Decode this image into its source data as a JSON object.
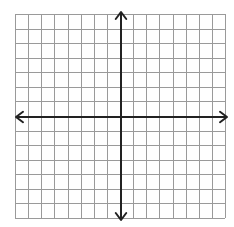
{
  "diagram": {
    "type": "coordinate-plane",
    "grid": {
      "columns": 16,
      "rows": 14,
      "left": 15,
      "top": 14,
      "right": 225,
      "bottom": 218,
      "line_color": "#9a9a9a",
      "line_width": 1
    },
    "axes": {
      "color": "#222222",
      "width": 2,
      "x_axis": {
        "y": 117,
        "x_start": 16,
        "x_end": 227,
        "arrows": "both"
      },
      "y_axis": {
        "x": 121,
        "y_start": 12,
        "y_end": 220,
        "arrows": "both"
      }
    },
    "labels": []
  }
}
